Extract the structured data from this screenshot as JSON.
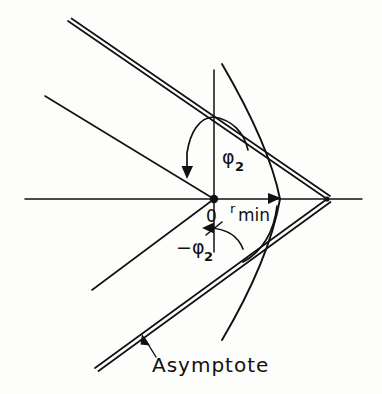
{
  "figure": {
    "type": "hyperbolic-orbit-diagram",
    "background_color": "#fdfdfc",
    "ink_color": "#111111",
    "labels": {
      "phi_positive": "φ",
      "phi_positive_sub": "2",
      "phi_negative": "−φ",
      "phi_negative_sub": "2",
      "origin": "0",
      "rmin_prefix": "r",
      "rmin_suffix": "min",
      "asymptote": "Asymptote"
    },
    "geometry": {
      "origin": {
        "x": 214,
        "y": 199
      },
      "horizontal_axis": {
        "x1": 25,
        "y1": 199,
        "x2": 362,
        "y2": 199
      },
      "vertical_axis": {
        "x1": 214,
        "y1": 70,
        "x2": 214,
        "y2": 252
      },
      "hyperbola_vertex": {
        "x": 280,
        "y": 199
      },
      "asymptote_crossing": {
        "x": 327,
        "y": 199
      },
      "upper_asymptote_start": {
        "x": 68,
        "y": 21
      },
      "lower_asymptote_end": {
        "x": 95,
        "y": 368
      },
      "upper_ray_start": {
        "x": 45,
        "y": 96
      },
      "lower_ray_end": {
        "x": 92,
        "y": 290
      },
      "rmin_arrow_tip": {
        "x": 278,
        "y": 199
      },
      "phi2_arrow_tip": {
        "x": 187,
        "y": 177
      },
      "neg_phi2_arrow_tip": {
        "x": 202,
        "y": 228
      }
    }
  }
}
